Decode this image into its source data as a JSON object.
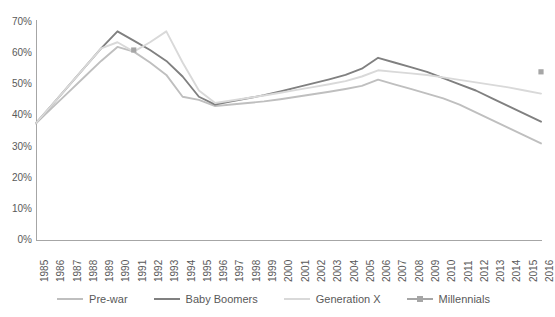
{
  "chart_data": {
    "type": "line",
    "title": "",
    "subtitle": "",
    "xlabel": "",
    "ylabel": "",
    "grid": false,
    "legend_position": "bottom",
    "ylim": [
      0,
      70
    ],
    "ytick_labels": [
      "0%",
      "10%",
      "20%",
      "30%",
      "40%",
      "50%",
      "60%",
      "70%"
    ],
    "ytick_values": [
      0,
      10,
      20,
      30,
      40,
      50,
      60,
      70
    ],
    "categories": [
      "1985",
      "1986",
      "1987",
      "1988",
      "1989",
      "1990",
      "1991",
      "1992",
      "1993",
      "1994",
      "1995",
      "1996",
      "1997",
      "1998",
      "1999",
      "2000",
      "2001",
      "2002",
      "2003",
      "2004",
      "2005",
      "2006",
      "2007",
      "2008",
      "2009",
      "2010",
      "2011",
      "2012",
      "2013",
      "2014",
      "2015",
      "2016"
    ],
    "series": [
      {
        "name": "Pre-war",
        "color": "#bfbfbf",
        "marker": false,
        "values": [
          37.5,
          42.5,
          47.5,
          52.5,
          57.5,
          62.0,
          60.5,
          57.0,
          53.0,
          46.0,
          45.0,
          43.0,
          43.5,
          44.0,
          44.5,
          45.2,
          46.0,
          46.8,
          47.6,
          48.5,
          49.5,
          51.5,
          50.0,
          48.5,
          47.0,
          45.5,
          43.5,
          41.0,
          38.5,
          36.0,
          33.5,
          31.0
        ]
      },
      {
        "name": "Baby Boomers",
        "color": "#808080",
        "marker": false,
        "values": [
          37.5,
          43.5,
          49.5,
          55.5,
          61.5,
          67.0,
          64.0,
          61.0,
          57.5,
          52.5,
          46.0,
          43.5,
          44.5,
          45.5,
          46.5,
          47.7,
          49.0,
          50.3,
          51.6,
          53.0,
          55.0,
          58.5,
          57.0,
          55.5,
          54.0,
          52.0,
          50.0,
          48.0,
          45.5,
          43.0,
          40.5,
          38.0
        ]
      },
      {
        "name": "Generation X",
        "color": "#d9d9d9",
        "marker": false,
        "values": [
          37.5,
          43.5,
          49.5,
          55.5,
          61.5,
          63.5,
          60.5,
          63.5,
          67.0,
          57.0,
          48.0,
          44.0,
          44.8,
          45.6,
          46.4,
          47.3,
          48.2,
          49.1,
          50.0,
          51.0,
          52.5,
          54.5,
          54.0,
          53.5,
          53.0,
          52.2,
          51.4,
          50.6,
          49.8,
          49.0,
          48.0,
          47.0
        ]
      },
      {
        "name": "Millennials",
        "color": "#a6a6a6",
        "marker": true,
        "values": [
          null,
          null,
          null,
          null,
          null,
          null,
          61.0,
          null,
          null,
          null,
          null,
          null,
          null,
          null,
          null,
          null,
          null,
          null,
          null,
          null,
          null,
          null,
          null,
          null,
          null,
          null,
          null,
          null,
          null,
          null,
          null,
          54.0
        ]
      }
    ]
  },
  "legend": {
    "items": [
      {
        "label": "Pre-war"
      },
      {
        "label": "Baby Boomers"
      },
      {
        "label": "Generation X"
      },
      {
        "label": "Millennials"
      }
    ]
  }
}
